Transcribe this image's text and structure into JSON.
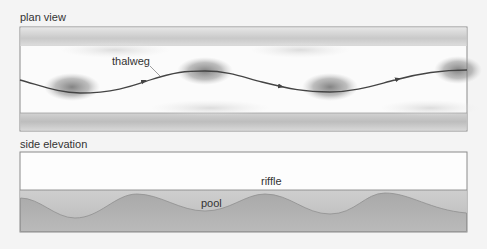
{
  "plan_view": {
    "title": "plan view",
    "thalweg_label": "thalweg"
  },
  "side_elevation": {
    "title": "side elevation",
    "riffle_label": "riffle",
    "pool_label": "pool"
  },
  "colors": {
    "background": "#f4f4f4",
    "frame": "#8a8a8a",
    "channel": "#fbfbfb",
    "bank": "#c8c8c8",
    "thalweg_line": "#444444",
    "bed": "#b4b4b4",
    "pool_shadow": "#7a7a7a"
  }
}
